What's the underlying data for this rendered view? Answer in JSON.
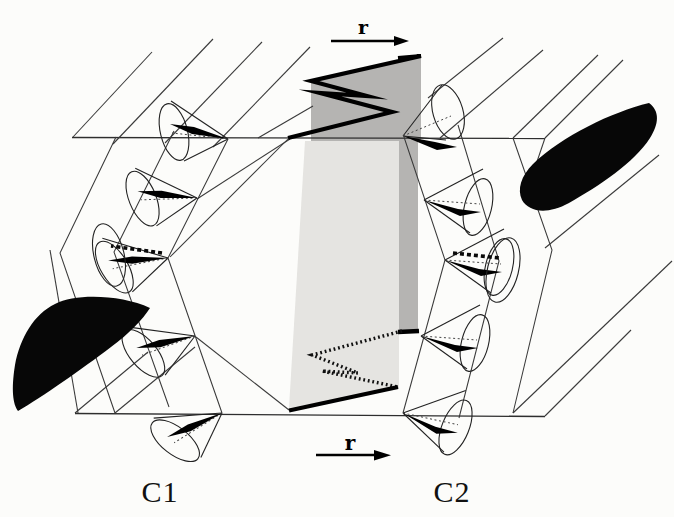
{
  "figure": {
    "labels": {
      "chevron_left": "C1",
      "chevron_right": "C2",
      "r_top": "r",
      "r_bottom": "r"
    },
    "colors": {
      "background": "#fcfcfa",
      "line": "#3a3a3a",
      "bold": "#000000",
      "wall_dark": "#b5b4b2",
      "wall_light": "#e5e4e1",
      "blob": "#070707"
    }
  }
}
